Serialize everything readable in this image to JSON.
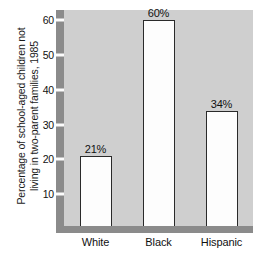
{
  "chart_data": {
    "type": "bar",
    "title": "",
    "xlabel": "",
    "ylabel_lines": [
      "Percentage of school-aged children not",
      "living in two-parent families, 1985"
    ],
    "ylabel": "Percentage of school-aged children not living in two-parent families, 1985",
    "categories": [
      "White",
      "Black",
      "Hispanic"
    ],
    "values": [
      21,
      60,
      34
    ],
    "value_labels": [
      "21%",
      "60%",
      "34%"
    ],
    "ylim": [
      0,
      63
    ],
    "yticks": [
      10,
      20,
      30,
      40,
      50,
      60
    ],
    "ytick_labels": [
      "10",
      "20",
      "30",
      "40",
      "50",
      "60"
    ],
    "grid": false,
    "legend": null,
    "colors": {
      "panel_background": "#cfcfcf",
      "axis_band": "#8b8b8b",
      "bar_fill": "#fdfdfd",
      "bar_outline": "#2a2a2a",
      "text": "#111111",
      "figure_background": "#ffffff"
    }
  }
}
